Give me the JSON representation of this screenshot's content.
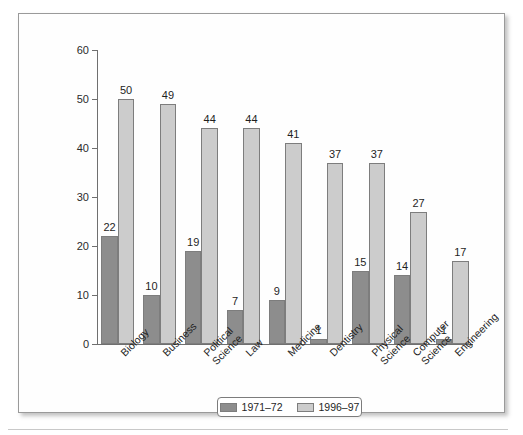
{
  "chart_data": {
    "type": "bar",
    "title": "",
    "subtitle": "",
    "xlabel": "",
    "ylabel": "",
    "ylim": [
      0,
      60
    ],
    "yticks": [
      0,
      10,
      20,
      30,
      40,
      50,
      60
    ],
    "grid": false,
    "legend_position": "bottom-center",
    "categories": [
      "Biology",
      "Business",
      "Political\nScience",
      "Law",
      "Medicine",
      "Dentistry",
      "Physical\nScience",
      "Computer\nScience",
      "Engineering"
    ],
    "series": [
      {
        "name": "1971–72",
        "color": "#8d8d8d",
        "values": [
          22,
          10,
          19,
          7,
          9,
          1,
          15,
          14,
          1
        ]
      },
      {
        "name": "1996–97",
        "color": "#cccccc",
        "values": [
          50,
          49,
          44,
          44,
          41,
          37,
          37,
          27,
          17
        ]
      }
    ],
    "bar_value_labels": true,
    "annotations": []
  },
  "legend": {
    "items": [
      {
        "label": "1971–72",
        "swatch": "dark-gray-swatch"
      },
      {
        "label": "1996–97",
        "swatch": "light-gray-swatch"
      }
    ]
  },
  "axes": {
    "y_tick_labels": [
      "0",
      "10",
      "20",
      "30",
      "40",
      "50",
      "60"
    ]
  },
  "colors": {
    "series1": "#8d8d8d",
    "series2": "#cccccc",
    "axis": "#6f6f6f",
    "frame": "#9a9a9a",
    "text": "#1f1f1f",
    "background": "#ffffff"
  }
}
